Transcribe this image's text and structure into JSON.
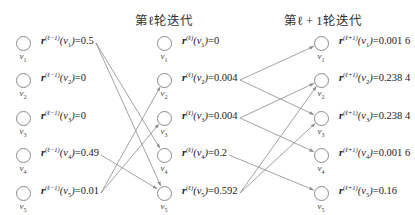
{
  "titles": {
    "iter_l": "第ℓ轮迭代",
    "iter_l1": "第ℓ + 1轮迭代"
  },
  "node_names": [
    "v1",
    "v2",
    "v3",
    "v4",
    "v5"
  ],
  "columns": [
    {
      "id": "l_minus_1",
      "superscript": "(ℓ−1)",
      "nodes": [
        {
          "node": "v1",
          "sub": "1",
          "value": "0.5"
        },
        {
          "node": "v2",
          "sub": "2",
          "value": "0"
        },
        {
          "node": "v3",
          "sub": "3",
          "value": "0"
        },
        {
          "node": "v4",
          "sub": "4",
          "value": "0.49"
        },
        {
          "node": "v5",
          "sub": "5",
          "value": "0.01"
        }
      ]
    },
    {
      "id": "l",
      "superscript": "(ℓ)",
      "nodes": [
        {
          "node": "v1",
          "sub": "1",
          "value": "0"
        },
        {
          "node": "v2",
          "sub": "2",
          "value": "0.004"
        },
        {
          "node": "v3",
          "sub": "3",
          "value": "0.004"
        },
        {
          "node": "v4",
          "sub": "4",
          "value": "0.2"
        },
        {
          "node": "v5",
          "sub": "5",
          "value": "0.592"
        }
      ]
    },
    {
      "id": "l_plus_1",
      "superscript": "(ℓ+1)",
      "nodes": [
        {
          "node": "v1",
          "sub": "1",
          "value": "0.001 6"
        },
        {
          "node": "v2",
          "sub": "2",
          "value": "0.238 4"
        },
        {
          "node": "v3",
          "sub": "3",
          "value": "0.238 4"
        },
        {
          "node": "v4",
          "sub": "4",
          "value": "0.001 6"
        },
        {
          "node": "v5",
          "sub": "5",
          "value": "0.16"
        }
      ]
    }
  ],
  "edges": {
    "l_minus_1_to_l": [
      [
        "v1",
        "v4"
      ],
      [
        "v1",
        "v5"
      ],
      [
        "v4",
        "v5"
      ],
      [
        "v5",
        "v2"
      ],
      [
        "v5",
        "v3"
      ]
    ],
    "l_to_l_plus_1": [
      [
        "v2",
        "v1"
      ],
      [
        "v2",
        "v3"
      ],
      [
        "v3",
        "v2"
      ],
      [
        "v3",
        "v4"
      ],
      [
        "v4",
        "v5"
      ],
      [
        "v5",
        "v2"
      ],
      [
        "v5",
        "v3"
      ]
    ]
  },
  "colors": {
    "edge": "#8c8c8c",
    "node_border": "#8a8a8a",
    "text": "#222222"
  }
}
